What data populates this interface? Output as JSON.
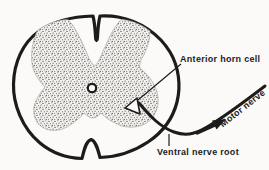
{
  "diagram": {
    "labels": {
      "anterior_horn_cell": "Anterior horn cell",
      "motor_nerve": "Motor nerve",
      "ventral_nerve_root": "Ventral nerve root"
    },
    "colors": {
      "ink": "#1c1c1c",
      "paper": "#fbfaf8",
      "stipple": "#4a4a4a"
    }
  }
}
